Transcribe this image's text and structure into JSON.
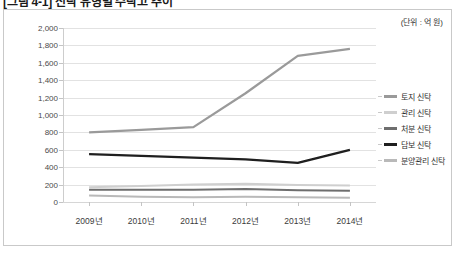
{
  "caption": "[그림 4-1] 신탁 유형별 수탁고 추이",
  "unit_note": "(단위 : 억 원)",
  "chart_data": {
    "type": "line",
    "title": "",
    "xlabel": "",
    "ylabel": "",
    "categories": [
      "2009년",
      "2010년",
      "2011년",
      "2012년",
      "2013년",
      "2014년"
    ],
    "ylim": [
      0,
      2000
    ],
    "ytick_labels": [
      "2,000",
      "1,800",
      "1,600",
      "1,400",
      "1,200",
      "1,000",
      "800",
      "600",
      "400",
      "200",
      "0"
    ],
    "ytick_values": [
      2000,
      1800,
      1600,
      1400,
      1200,
      1000,
      800,
      600,
      400,
      200,
      0
    ],
    "grid": true,
    "legend_position": "right",
    "series": [
      {
        "name": "토지 신탁",
        "color": "#9a9a9a",
        "width": 2.2,
        "values": [
          800,
          830,
          860,
          1250,
          1680,
          1760
        ]
      },
      {
        "name": "관리 신탁",
        "color": "#cfcfcf",
        "width": 2.0,
        "values": [
          170,
          185,
          200,
          210,
          195,
          190
        ]
      },
      {
        "name": "처분 신탁",
        "color": "#6e6e6e",
        "width": 2.0,
        "values": [
          140,
          140,
          140,
          150,
          135,
          130
        ]
      },
      {
        "name": "담보 신탁",
        "color": "#1f1f1f",
        "width": 2.4,
        "values": [
          550,
          530,
          510,
          490,
          450,
          600
        ]
      },
      {
        "name": "분양관리 신탁",
        "color": "#b9b9b9",
        "width": 2.0,
        "values": [
          75,
          60,
          55,
          60,
          55,
          50
        ]
      }
    ]
  }
}
